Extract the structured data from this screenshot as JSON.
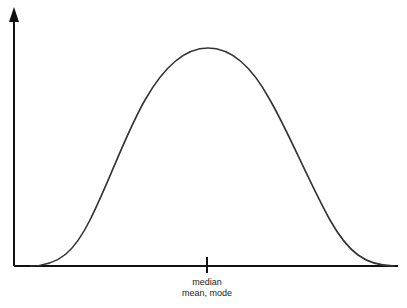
{
  "diagram": {
    "type": "symmetric-distribution",
    "center_marker": {
      "line1": "median",
      "line2": "mean, mode"
    },
    "colors": {
      "axis": "#111111",
      "curve": "#333333",
      "background": "#ffffff"
    }
  }
}
